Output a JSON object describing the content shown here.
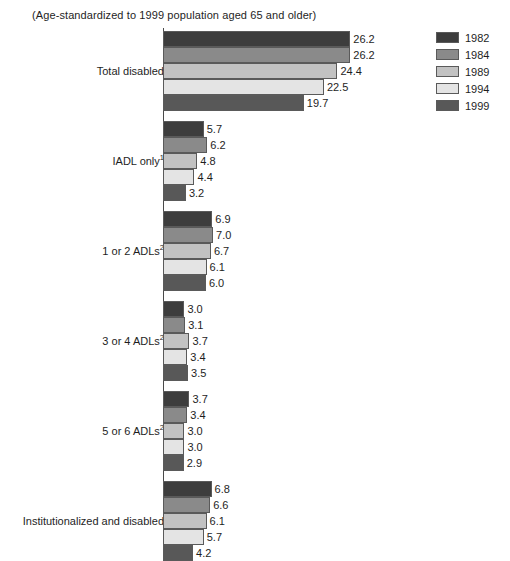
{
  "subtitle": "(Age-standardized to 1999 population aged 65 and older)",
  "legend": {
    "position": "right",
    "items": [
      {
        "label": "1982",
        "color": "#3d3d3d"
      },
      {
        "label": "1984",
        "color": "#8a8a8a"
      },
      {
        "label": "1989",
        "color": "#c2c2c2"
      },
      {
        "label": "1994",
        "color": "#e4e4e4"
      },
      {
        "label": "1999",
        "color": "#585858"
      }
    ]
  },
  "chart_data": {
    "type": "bar",
    "orientation": "horizontal",
    "title": "",
    "subtitle": "(Age-standardized to 1999 population aged 65 and older)",
    "xlabel": "",
    "ylabel": "",
    "xlim": [
      0,
      26.2
    ],
    "grid": false,
    "categories": [
      "Total disabled",
      "IADL only",
      "1 or 2 ADLs",
      "3 or 4 ADLs",
      "5 or 6 ADLs",
      "Institutionalized and disabled"
    ],
    "category_footnotes": [
      "",
      "1",
      "2",
      "2",
      "2",
      ""
    ],
    "series": [
      {
        "name": "1982",
        "color": "#3d3d3d",
        "values": [
          26.2,
          5.7,
          6.9,
          3.0,
          3.7,
          6.8
        ]
      },
      {
        "name": "1984",
        "color": "#8a8a8a",
        "values": [
          26.2,
          6.2,
          7.0,
          3.1,
          3.4,
          6.6
        ]
      },
      {
        "name": "1989",
        "color": "#c2c2c2",
        "values": [
          24.4,
          4.8,
          6.7,
          3.7,
          3.0,
          6.1
        ]
      },
      {
        "name": "1994",
        "color": "#e4e4e4",
        "values": [
          22.5,
          4.4,
          6.1,
          3.4,
          3.0,
          5.7
        ]
      },
      {
        "name": "1999",
        "color": "#585858",
        "values": [
          19.7,
          3.2,
          6.0,
          3.5,
          2.9,
          4.2
        ]
      }
    ]
  }
}
